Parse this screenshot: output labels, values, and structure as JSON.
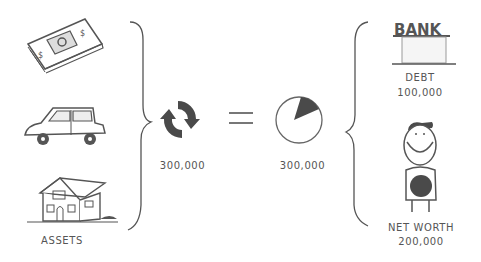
{
  "diagram": {
    "assets": {
      "label": "ASSETS",
      "items": [
        {
          "icon": "money-stack-icon"
        },
        {
          "icon": "car-icon"
        },
        {
          "icon": "house-icon"
        }
      ]
    },
    "liquidity": {
      "icon": "refresh-cycle-icon",
      "value": "300,000"
    },
    "operator": "=",
    "equity_pie": {
      "icon": "pie-chart-icon",
      "value": "300,000",
      "shaded_fraction": 0.17
    },
    "liabilities": {
      "bank": {
        "sign": "BANK",
        "label": "DEBT",
        "value": "100,000"
      },
      "person": {
        "label": "NET WORTH",
        "value": "200,000"
      }
    },
    "colors": {
      "stroke": "#555555",
      "fill_dark": "#4a4a4a",
      "background": "#ffffff"
    }
  }
}
